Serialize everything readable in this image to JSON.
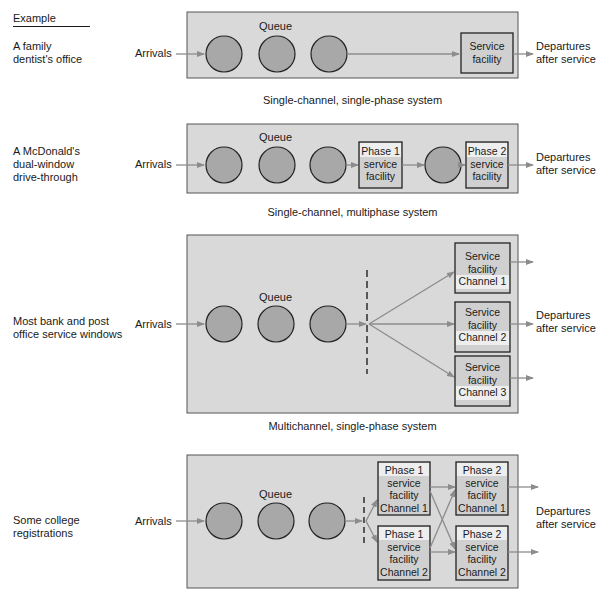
{
  "example_header": "Example",
  "colors": {
    "panel_fill": "#d9d9d9",
    "panel_border": "#555555",
    "circle_fill": "#a8a8a8",
    "box_fill": "#d0d0d0",
    "box_highlight": "#eeeeee",
    "arrow": "#8c8c8c",
    "text": "#1a1a1a"
  },
  "panels": [
    {
      "example": "A family\ndentist's office",
      "queue_label": "Queue",
      "arrivals_label": "Arrivals",
      "departures_label": "Departures\nafter service",
      "caption": "Single-channel, single-phase system",
      "facilities": [
        {
          "text": "Service\nfacility"
        }
      ]
    },
    {
      "example": "A McDonald's\ndual-window\ndrive-through",
      "queue_label": "Queue",
      "arrivals_label": "Arrivals",
      "departures_label": "Departures\nafter service",
      "caption": "Single-channel, multiphase system",
      "facilities": [
        {
          "text": "Phase 1\nservice\nfacility"
        },
        {
          "text": "Phase 2\nservice\nfacility"
        }
      ]
    },
    {
      "example": "Most bank and post\noffice service windows",
      "queue_label": "Queue",
      "arrivals_label": "Arrivals",
      "departures_label": "Departures\nafter service",
      "caption": "Multichannel, single-phase system",
      "facilities": [
        {
          "text": "Service\nfacility\nChannel 1"
        },
        {
          "text": "Service\nfacility\nChannel 2"
        },
        {
          "text": "Service\nfacility\nChannel 3"
        }
      ]
    },
    {
      "example": "Some college\nregistrations",
      "queue_label": "Queue",
      "arrivals_label": "Arrivals",
      "departures_label": "Departures\nafter service",
      "caption": "",
      "facilities": [
        {
          "text": "Phase 1\nservice\nfacility\nChannel 1"
        },
        {
          "text": "Phase 1\nservice\nfacility\nChannel 2"
        },
        {
          "text": "Phase 2\nservice\nfacility\nChannel 1"
        },
        {
          "text": "Phase 2\nservice\nfacility\nChannel 2"
        }
      ]
    }
  ]
}
